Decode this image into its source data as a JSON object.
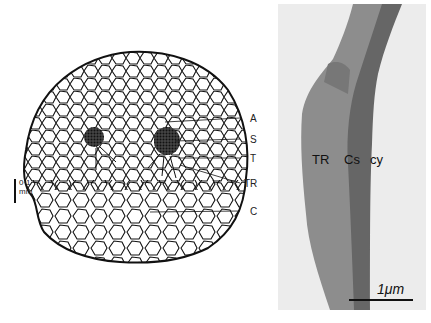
{
  "figure": {
    "left_panel": {
      "type": "transverse section drawing",
      "labels": [
        "A",
        "S",
        "T",
        "TR",
        "C"
      ],
      "scale_bar": {
        "line1": "0·1",
        "line2": "mm"
      }
    },
    "right_panel": {
      "type": "electron micrograph",
      "labels": [
        "TR",
        "Cs",
        "cy"
      ],
      "scale_bar": "1μm"
    }
  }
}
